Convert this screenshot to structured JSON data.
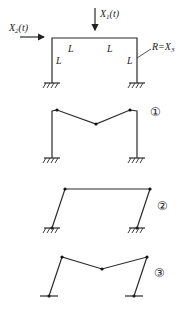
{
  "diagram": {
    "loads": {
      "x1": {
        "text": "X",
        "sub": "1",
        "arg": "(t)"
      },
      "x2": {
        "text": "X",
        "sub": "2",
        "arg": "(t)"
      },
      "r": {
        "text": "R=X",
        "sub": "3"
      }
    },
    "member_label": "L",
    "modes": [
      {
        "label": "①",
        "support": "fixed"
      },
      {
        "label": "②",
        "support": "fixed"
      },
      {
        "label": "③",
        "support": "pinned"
      }
    ]
  }
}
